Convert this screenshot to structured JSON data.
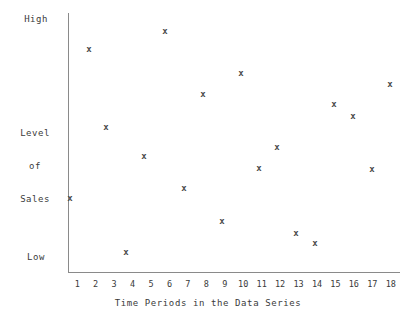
{
  "chart_data": {
    "type": "scatter",
    "title": "",
    "xlabel": "Time Periods in the Data Series",
    "ylabel": "Level of Sales",
    "ylabel_lines": [
      "Level",
      "of",
      "Sales"
    ],
    "y_axis_top_label": "High",
    "y_axis_bottom_label": "Low",
    "y_tick_labels": [
      "High",
      "Low"
    ],
    "ylim_labels": [
      "Low",
      "High"
    ],
    "grid": false,
    "legend": false,
    "marker": "x",
    "marker_color": "#4a4a4a",
    "axis_color": "#8a8a8a",
    "x": [
      1,
      2,
      3,
      4,
      5,
      6,
      7,
      8,
      9,
      10,
      11,
      12,
      13,
      14,
      15,
      16,
      17,
      18
    ],
    "x_tick_labels": [
      "1",
      "2",
      "3",
      "4",
      "5",
      "6",
      "7",
      "8",
      "9",
      "10",
      "11",
      "12",
      "13",
      "14",
      "15",
      "16",
      "17",
      "18"
    ],
    "xlim": [
      0.5,
      18.5
    ],
    "values_normalized": [
      0.285,
      0.845,
      0.585,
      0.075,
      0.5,
      0.93,
      0.385,
      0.705,
      0.215,
      0.78,
      0.44,
      0.545,
      0.16,
      0.125,
      0.665,
      0.625,
      0.435,
      0.755
    ],
    "points": [
      {
        "x": 1,
        "y": 0.285,
        "px": 70,
        "py": 199
      },
      {
        "x": 2,
        "y": 0.845,
        "px": 89,
        "py": 50
      },
      {
        "x": 3,
        "y": 0.585,
        "px": 106,
        "py": 128
      },
      {
        "x": 4,
        "y": 0.075,
        "px": 126,
        "py": 253
      },
      {
        "x": 5,
        "y": 0.5,
        "px": 144,
        "py": 157
      },
      {
        "x": 6,
        "y": 0.93,
        "px": 165,
        "py": 32
      },
      {
        "x": 7,
        "y": 0.385,
        "px": 184,
        "py": 189
      },
      {
        "x": 8,
        "y": 0.705,
        "px": 203,
        "py": 95
      },
      {
        "x": 9,
        "y": 0.215,
        "px": 222,
        "py": 222
      },
      {
        "x": 10,
        "y": 0.78,
        "px": 241,
        "py": 74
      },
      {
        "x": 11,
        "y": 0.44,
        "px": 259,
        "py": 169
      },
      {
        "x": 12,
        "y": 0.545,
        "px": 277,
        "py": 148
      },
      {
        "x": 13,
        "y": 0.16,
        "px": 296,
        "py": 234
      },
      {
        "x": 14,
        "y": 0.125,
        "px": 315,
        "py": 244
      },
      {
        "x": 15,
        "y": 0.665,
        "px": 334,
        "py": 105
      },
      {
        "x": 16,
        "y": 0.625,
        "px": 353,
        "py": 117
      },
      {
        "x": 17,
        "y": 0.435,
        "px": 372,
        "py": 170
      },
      {
        "x": 18,
        "y": 0.755,
        "px": 390,
        "py": 85
      }
    ]
  }
}
